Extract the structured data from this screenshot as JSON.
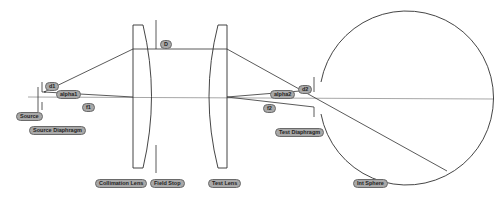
{
  "diagram": {
    "type": "optical-layout",
    "colors": {
      "line": "#303030",
      "axis": "#909090",
      "label_bg": "#a8a8a8",
      "label_border": "#6a6a6a"
    },
    "labels": {
      "source": "Source",
      "source_diaphragm": "Source Diaphragm",
      "d1": "d1",
      "alpha1": "alpha1",
      "f1": "f1",
      "D": "D",
      "collimation_lens": "Collimation Lens",
      "field_stop": "Field Stop",
      "test_lens": "Test Lens",
      "alpha2": "alpha2",
      "d2": "d2",
      "f2": "f2",
      "test_diaphragm": "Test Diaphragm",
      "int_sphere": "Int Sphere"
    }
  }
}
